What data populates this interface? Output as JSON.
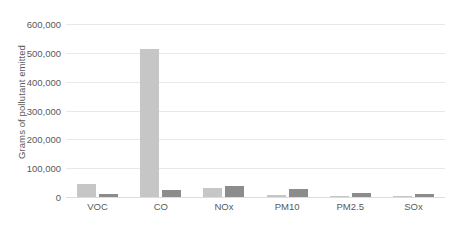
{
  "chart_data": {
    "type": "bar",
    "title": "",
    "subtitle": "",
    "xlabel": "",
    "ylabel": "Grams of pollutant emitted",
    "categories": [
      "VOC",
      "CO",
      "NOx",
      "PM10",
      "PM2.5",
      "SOx"
    ],
    "series": [
      {
        "name": "series-a",
        "color": "#c6c6c6",
        "values": [
          45000,
          512000,
          30000,
          7000,
          4000,
          4000
        ]
      },
      {
        "name": "series-b",
        "color": "#8c8c8c",
        "values": [
          10000,
          24000,
          38000,
          27000,
          14000,
          9000
        ]
      }
    ],
    "ylim": [
      0,
      600000
    ],
    "y_ticks": [
      0,
      100000,
      200000,
      300000,
      400000,
      500000,
      600000
    ],
    "y_tick_labels": [
      "0",
      "100,000",
      "200,000",
      "300,000",
      "400,000",
      "500,000",
      "600,000"
    ],
    "grid": true,
    "grid_axis": "y",
    "legend": false,
    "legend_position": "none",
    "annotations": []
  },
  "colors": {
    "background": "#ffffff",
    "grid": "#e8e8e8",
    "baseline": "#dcdcdc",
    "text": "#5a5a5a",
    "series_a": "#c6c6c6",
    "series_b": "#8c8c8c"
  }
}
